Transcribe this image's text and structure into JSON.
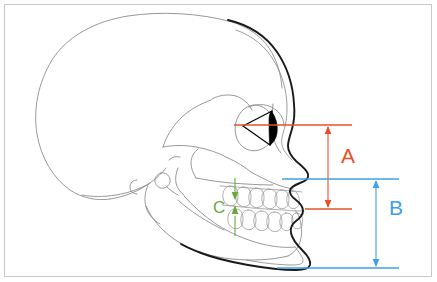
{
  "figure": {
    "background_color": "#ffffff",
    "frame_color": "#c9c9c9",
    "width": 437,
    "height": 282
  },
  "colors": {
    "skull_outline": "#8c8c92",
    "soft_tissue_profile": "#1a1a1a",
    "measure_a": "#e8502a",
    "measure_b": "#3fa0e8",
    "measure_c": "#6aa83a",
    "eye_fill": "#000000"
  },
  "measurements": [
    {
      "id": "A",
      "label": "A",
      "color": "#e8502a",
      "label_x": 341,
      "label_y": 155,
      "description": "Midface height: from orbital/eye reference line down to the maxillary occlusal reference line",
      "upper_line_y": 125,
      "lower_line_y": 209,
      "arrow_x": 328,
      "upper_line_x1": 234,
      "upper_line_x2": 352,
      "lower_line_x1": 305,
      "lower_line_x2": 352
    },
    {
      "id": "B",
      "label": "B",
      "color": "#3fa0e8",
      "label_x": 389,
      "label_y": 207,
      "description": "Lower face height: from subnasal reference line down to the menton reference line",
      "upper_line_y": 179,
      "lower_line_y": 268,
      "arrow_x": 376,
      "upper_line_x1": 282,
      "upper_line_x2": 399,
      "lower_line_x1": 277,
      "lower_line_x2": 399
    },
    {
      "id": "C",
      "label": "C",
      "color": "#6aa83a",
      "label_x": 219,
      "label_y": 206,
      "description": "Incisal overbite: vertical overlap between upper and lower incisor edges",
      "arrow_x": 235,
      "arrow_top_y": 192,
      "arrow_bottom_y": 222
    }
  ],
  "anatomy": {
    "structures": [
      "cranial vault",
      "frontal bone",
      "orbit",
      "nasal bone",
      "zygomatic arch",
      "maxilla",
      "maxillary teeth",
      "mandibular teeth",
      "mandible",
      "mandibular ramus",
      "condyle",
      "soft tissue facial profile",
      "eye globe"
    ]
  }
}
